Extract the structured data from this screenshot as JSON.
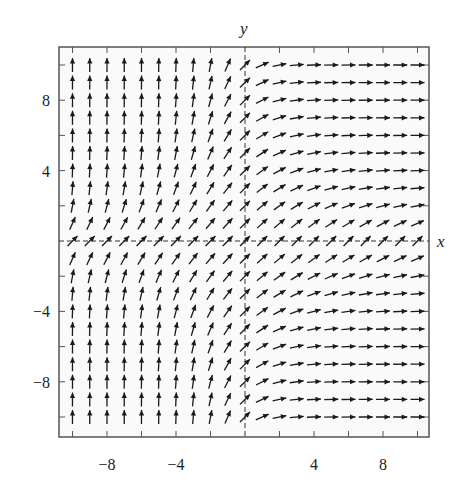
{
  "chart_data": {
    "type": "vector_field",
    "title": "",
    "xlabel": "x",
    "ylabel": "y",
    "xlim": [
      -11,
      11
    ],
    "ylim": [
      -11,
      11
    ],
    "grid": false,
    "axes_style": "dashed lines through origin",
    "x_tick_values": [
      -10,
      -8,
      -6,
      -4,
      -2,
      0,
      2,
      4,
      6,
      8,
      10
    ],
    "x_tick_labels": [
      {
        "value": -8,
        "label": "−8"
      },
      {
        "value": -4,
        "label": "−4"
      },
      {
        "value": 4,
        "label": "4"
      },
      {
        "value": 8,
        "label": "8"
      }
    ],
    "y_tick_values": [
      -10,
      -8,
      -6,
      -4,
      -2,
      0,
      2,
      4,
      6,
      8,
      10
    ],
    "y_tick_labels": [
      {
        "value": 8,
        "label": "8"
      },
      {
        "value": 4,
        "label": "4"
      },
      {
        "value": -4,
        "label": "−4"
      },
      {
        "value": -8,
        "label": "−8"
      }
    ],
    "arrow_grid": {
      "x_from": -10,
      "x_to": 10,
      "y_from": -10,
      "y_to": 10,
      "step": 1
    },
    "field_description": "Unit-length slope arrows; slope 1 (45°) along both axes; arrows become vertical for x<0 with large |x·y| and horizontal for x>0 with large |x·y|; symmetric about the x-axis",
    "field_model": {
      "dx": "exp(x*|y|/c)",
      "dy": "1",
      "c": 12
    }
  },
  "colors": {
    "arrow": "#1a1a1a",
    "frame": "#555555",
    "background": "#fafafa",
    "axis": "#333333"
  }
}
